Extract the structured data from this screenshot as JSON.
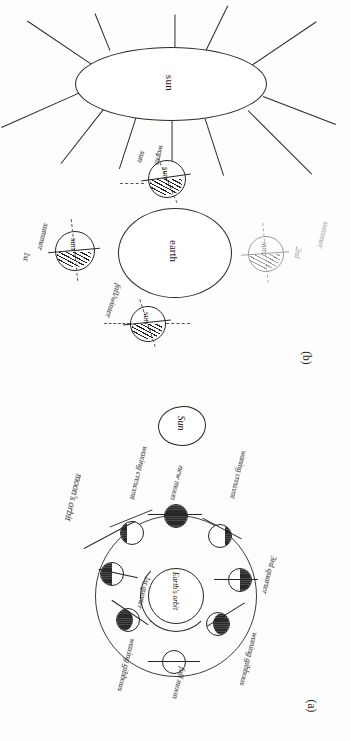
{
  "figure": {
    "orientation_note": "page scanned rotated 90 degrees clockwise",
    "background_color": "#fdfdfc",
    "ink_color": "#1e1e1e",
    "faint_ink_color": "#9a9a9a"
  },
  "panel_b": {
    "caption": "(b)",
    "sun": {
      "label": "sun",
      "ray_count": 12
    },
    "earth": {
      "label": "earth"
    },
    "globes": [
      {
        "position": "top",
        "label": "sun",
        "annotations": [
          "warm",
          "sun"
        ],
        "faint": false
      },
      {
        "position": "left",
        "label": "sun",
        "annotations": [
          "summer",
          "1st"
        ],
        "faint": false
      },
      {
        "position": "right",
        "label": "sun",
        "annotations": [
          "summer",
          "2nd"
        ],
        "faint": true
      },
      {
        "position": "bottom",
        "label": "sun",
        "annotations": [
          "fall/winter"
        ],
        "faint": false
      }
    ]
  },
  "panel_a": {
    "caption": "(a)",
    "sun": {
      "label": "Sun"
    },
    "earth": {
      "label": "Earth's orbit"
    },
    "orbit_label": "moon's orbit",
    "phases": [
      {
        "name": "new moon",
        "shape": "new"
      },
      {
        "name": "waxing crescent",
        "shape": "cres-l"
      },
      {
        "name": "1st quarter",
        "shape": "half-l"
      },
      {
        "name": "waxing gibbous",
        "shape": "gib-l"
      },
      {
        "name": "full moon",
        "shape": "full"
      },
      {
        "name": "waning gibbous",
        "shape": "gib-r"
      },
      {
        "name": "3rd quarter",
        "shape": "half-r"
      },
      {
        "name": "waning crescent",
        "shape": "cres-r"
      }
    ],
    "sun_rays_label": "sun's rays (light)"
  }
}
